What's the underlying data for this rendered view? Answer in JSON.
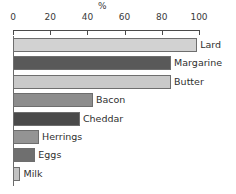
{
  "chart_data": {
    "type": "bar",
    "orientation": "horizontal",
    "title": "",
    "subtitle": "",
    "xlabel": "%",
    "ylabel": "",
    "xlim": [
      0,
      100
    ],
    "grid": false,
    "legend": null,
    "axis_unit_label": "%",
    "tick_labels": [
      "0",
      "20",
      "40",
      "60",
      "80",
      "100"
    ],
    "ticks": [
      0,
      20,
      40,
      60,
      80,
      100
    ],
    "categories": [
      "Lard",
      "Margarine",
      "Butter",
      "Bacon",
      "Cheddar",
      "Herrings",
      "Eggs",
      "Milk"
    ],
    "values": [
      99,
      85,
      85,
      43,
      36,
      14,
      12,
      4
    ],
    "bars": [
      {
        "label": "Lard",
        "value": 99,
        "color": "#d2d2d2"
      },
      {
        "label": "Margarine",
        "value": 85,
        "color": "#595959"
      },
      {
        "label": "Butter",
        "value": 85,
        "color": "#c9c9c9"
      },
      {
        "label": "Bacon",
        "value": 43,
        "color": "#8d8d8d"
      },
      {
        "label": "Cheddar",
        "value": 36,
        "color": "#4a4a4a"
      },
      {
        "label": "Herrings",
        "value": 14,
        "color": "#949494"
      },
      {
        "label": "Eggs",
        "value": 12,
        "color": "#6f6f6f"
      },
      {
        "label": "Milk",
        "value": 4,
        "color": "#c2c2c2"
      }
    ]
  },
  "colors": {
    "background": "#ffffff",
    "axis": "#4a4a4a",
    "text": "#2f2f2f",
    "bar_outline": "#6e6e6e"
  }
}
